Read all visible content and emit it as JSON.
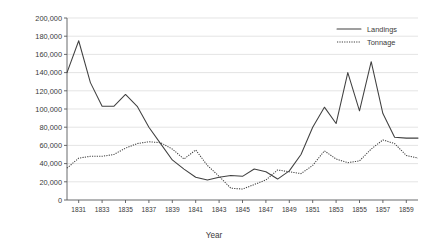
{
  "chart_data": {
    "type": "line",
    "title": "",
    "xlabel": "Year",
    "ylabel": "",
    "xlim": [
      1830,
      1860
    ],
    "ylim": [
      0,
      200000
    ],
    "grid": true,
    "legend_position": "top-right",
    "x": [
      1830,
      1831,
      1832,
      1833,
      1834,
      1835,
      1836,
      1837,
      1838,
      1839,
      1840,
      1841,
      1842,
      1843,
      1844,
      1845,
      1846,
      1847,
      1848,
      1849,
      1850,
      1851,
      1852,
      1853,
      1854,
      1855,
      1856,
      1857,
      1858,
      1859,
      1860
    ],
    "xticks": [
      1831,
      1833,
      1835,
      1837,
      1839,
      1841,
      1843,
      1845,
      1847,
      1849,
      1851,
      1853,
      1855,
      1857,
      1859
    ],
    "xtick_labels": [
      "1831",
      "1833",
      "1835",
      "1837",
      "1839",
      "1841",
      "1843",
      "1845",
      "1847",
      "1849",
      "1851",
      "1853",
      "1855",
      "1857",
      "1859"
    ],
    "yticks": [
      0,
      20000,
      40000,
      60000,
      80000,
      100000,
      120000,
      140000,
      160000,
      180000,
      200000
    ],
    "ytick_labels": [
      "0",
      "20,000",
      "40,000",
      "60,000",
      "80,000",
      "100,000",
      "120,000",
      "140,000",
      "160,000",
      "180,000",
      "200,000"
    ],
    "series": [
      {
        "name": "Landings",
        "style": "solid",
        "color": "#404040",
        "values": [
          140000,
          175000,
          129000,
          103000,
          103000,
          116000,
          103000,
          80000,
          62000,
          44000,
          34000,
          25000,
          22000,
          25000,
          27000,
          26000,
          34000,
          31000,
          23000,
          32000,
          50000,
          80000,
          102000,
          84000,
          140000,
          98000,
          152000,
          95000,
          69000,
          68000,
          68000
        ]
      },
      {
        "name": "Tonnage",
        "style": "dotted",
        "color": "#404040",
        "values": [
          35000,
          46000,
          48000,
          48000,
          50000,
          57000,
          62000,
          64000,
          63000,
          56000,
          45000,
          55000,
          38000,
          26000,
          13000,
          12000,
          17000,
          22000,
          33000,
          31000,
          29000,
          38000,
          54000,
          45000,
          41000,
          43000,
          56000,
          66000,
          62000,
          49000,
          46000
        ]
      }
    ]
  },
  "legend": {
    "items": [
      {
        "label": "Landings",
        "style": "solid"
      },
      {
        "label": "Tonnage",
        "style": "dotted"
      }
    ]
  },
  "axes": {
    "x_title": "Year"
  }
}
